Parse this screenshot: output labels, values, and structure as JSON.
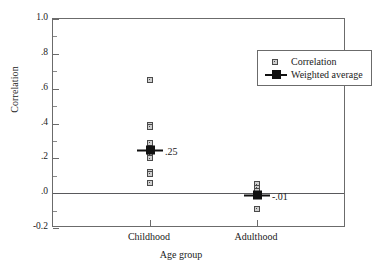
{
  "chart_data": {
    "type": "scatter",
    "title": "",
    "xlabel": "Age group",
    "ylabel": "Correlation",
    "categories": [
      "Childhood",
      "Adulthood"
    ],
    "ylim": [
      -0.2,
      1.0
    ],
    "ytick_major": [
      "1.0",
      ".8",
      ".6",
      ".4",
      ".2",
      ".0",
      "-0.2"
    ],
    "ytick_major_values": [
      1.0,
      0.8,
      0.6,
      0.4,
      0.2,
      0.0,
      -0.2
    ],
    "ytick_minor_values": [
      0.9,
      0.7,
      0.5,
      0.3,
      0.1,
      -0.1
    ],
    "grid": false,
    "zero_reference_line": true,
    "legend_position": "top-right",
    "series": [
      {
        "name": "Correlation",
        "marker": "open-square",
        "points": [
          {
            "group": "Childhood",
            "value": 0.65
          },
          {
            "group": "Childhood",
            "value": 0.39
          },
          {
            "group": "Childhood",
            "value": 0.38
          },
          {
            "group": "Childhood",
            "value": 0.29
          },
          {
            "group": "Childhood",
            "value": 0.25
          },
          {
            "group": "Childhood",
            "value": 0.22
          },
          {
            "group": "Childhood",
            "value": 0.2
          },
          {
            "group": "Childhood",
            "value": 0.12
          },
          {
            "group": "Childhood",
            "value": 0.11
          },
          {
            "group": "Childhood",
            "value": 0.06
          },
          {
            "group": "Adulthood",
            "value": 0.05
          },
          {
            "group": "Adulthood",
            "value": 0.03
          },
          {
            "group": "Adulthood",
            "value": 0.01
          },
          {
            "group": "Adulthood",
            "value": -0.01
          },
          {
            "group": "Adulthood",
            "value": -0.09
          }
        ]
      },
      {
        "name": "Weighted average",
        "marker": "filled-square-with-bar",
        "points": [
          {
            "group": "Childhood",
            "value": 0.25,
            "label": ".25"
          },
          {
            "group": "Adulthood",
            "value": -0.01,
            "label": "-.01"
          }
        ]
      }
    ]
  },
  "legend": {
    "items": [
      {
        "label": "Correlation"
      },
      {
        "label": "Weighted average"
      }
    ]
  },
  "axes": {
    "y_title": "Correlation",
    "x_title": "Age group",
    "y_labels": [
      "1.0",
      ".8",
      ".6",
      ".4",
      ".2",
      ".0",
      "-0.2"
    ],
    "x_labels": [
      "Childhood",
      "Adulthood"
    ]
  },
  "annotations": [
    {
      "text": ".25"
    },
    {
      "text": "-.01"
    }
  ]
}
